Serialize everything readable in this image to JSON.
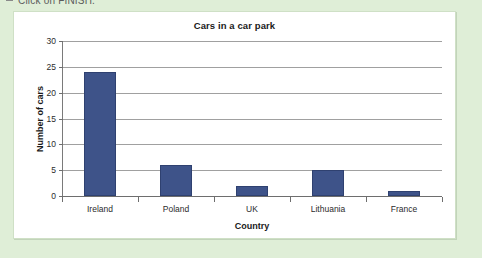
{
  "page": {
    "instruction_text": "Click on FINISH.",
    "background_color": "#dfeed7",
    "panel_background": "#ffffff"
  },
  "chart_data": {
    "type": "bar",
    "title": "Cars in a car park",
    "xlabel": "Country",
    "ylabel": "Number of cars",
    "categories": [
      "Ireland",
      "Poland",
      "UK",
      "Lithuania",
      "France"
    ],
    "values": [
      24,
      6,
      2,
      5,
      1
    ],
    "ylim": [
      0,
      30
    ],
    "yticks": [
      0,
      5,
      10,
      15,
      20,
      25,
      30
    ],
    "grid": true,
    "legend": false,
    "bar_color": "#3e5389",
    "gridline_color": "#a0a0a0",
    "axis_color": "#6e6e6e"
  }
}
